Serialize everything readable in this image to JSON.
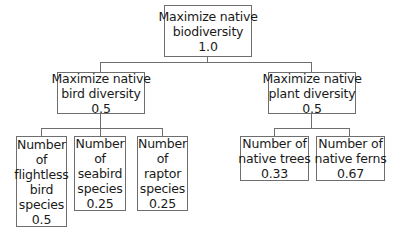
{
  "diagram": {
    "type": "hierarchy",
    "root": {
      "label_lines": [
        "Maximize native",
        "biodiversity"
      ],
      "weight": "1.0"
    },
    "level2": [
      {
        "label_lines": [
          "Maximize native",
          "bird diversity"
        ],
        "weight": "0.5",
        "children": [
          {
            "label_lines": [
              "Number",
              "of",
              "flightless",
              "bird",
              "species"
            ],
            "weight": "0.5"
          },
          {
            "label_lines": [
              "Number",
              "of",
              "seabird",
              "species"
            ],
            "weight": "0.25"
          },
          {
            "label_lines": [
              "Number",
              "of",
              "raptor",
              "species"
            ],
            "weight": "0.25"
          }
        ]
      },
      {
        "label_lines": [
          "Maximize native",
          "plant diversity"
        ],
        "weight": "0.5",
        "children": [
          {
            "label_lines": [
              "Number of",
              "native trees"
            ],
            "weight": "0.33"
          },
          {
            "label_lines": [
              "Number of",
              "native ferns"
            ],
            "weight": "0.67"
          }
        ]
      }
    ]
  }
}
